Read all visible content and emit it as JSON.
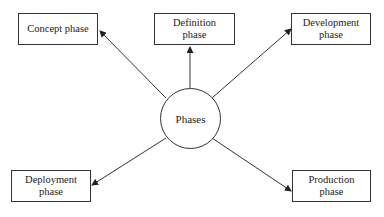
{
  "diagram": {
    "center": {
      "label": "Phases"
    },
    "nodes": [
      {
        "id": "concept",
        "label": "Concept phase"
      },
      {
        "id": "definition",
        "label": "Definition phase"
      },
      {
        "id": "development",
        "label": "Development phase"
      },
      {
        "id": "deployment",
        "label": "Deployment phase"
      },
      {
        "id": "production",
        "label": "Production phase"
      }
    ],
    "edges": [
      {
        "from": "Phases",
        "to": "Concept phase"
      },
      {
        "from": "Phases",
        "to": "Definition phase"
      },
      {
        "from": "Phases",
        "to": "Development phase"
      },
      {
        "from": "Phases",
        "to": "Deployment phase"
      },
      {
        "from": "Phases",
        "to": "Production phase"
      }
    ]
  }
}
